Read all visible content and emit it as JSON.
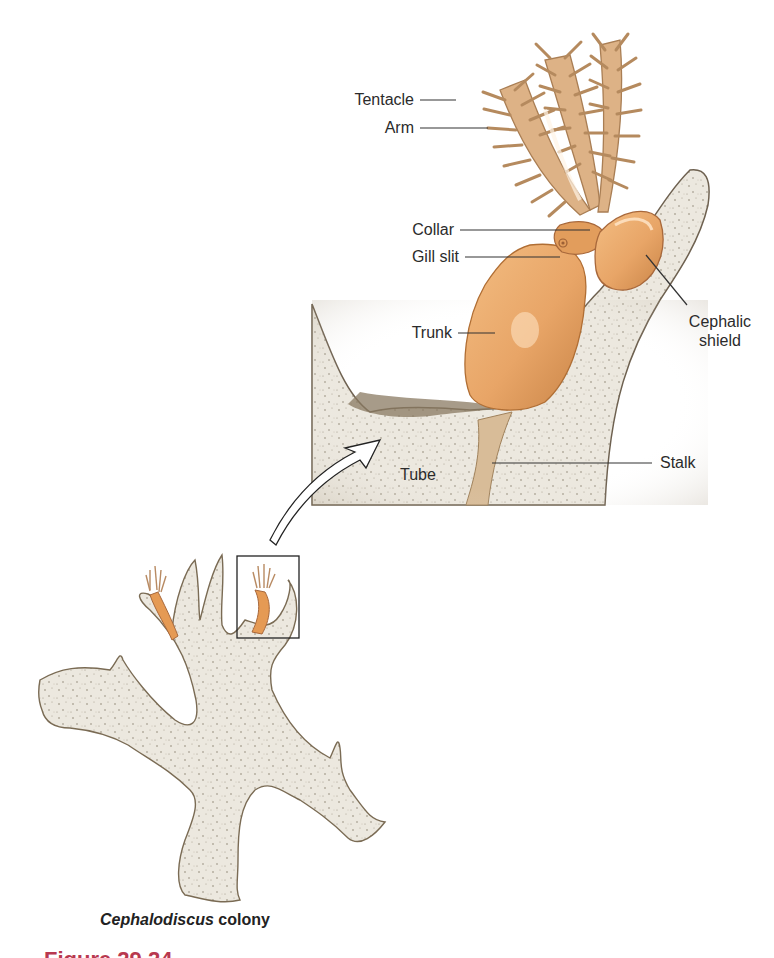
{
  "figure": {
    "title_partial": "Figure 29.24",
    "caption_species": "Cephalodiscus",
    "caption_rest": " colony",
    "colors": {
      "zooid_orange": "#e8a567",
      "tube_grey": "#e6e1d6",
      "tube_edge": "#8a7a62",
      "tentacle_tan": "#d4a77a",
      "label_text": "#2b2b2b",
      "figure_label_red": "#b8384f"
    }
  },
  "labels": {
    "tentacle": "Tentacle",
    "arm": "Arm",
    "collar": "Collar",
    "gill_slit": "Gill slit",
    "trunk": "Trunk",
    "cephalic_shield_line1": "Cephalic",
    "cephalic_shield_line2": "shield",
    "tube": "Tube",
    "stalk": "Stalk"
  }
}
